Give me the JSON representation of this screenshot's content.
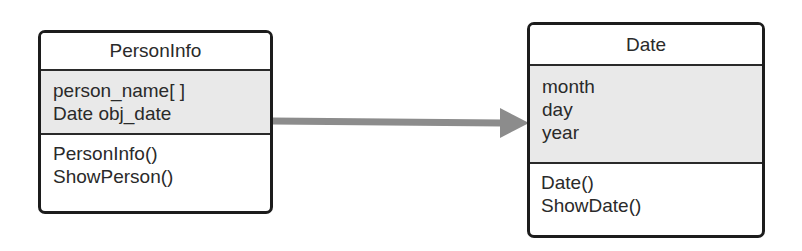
{
  "diagram": {
    "type": "uml-class-diagram",
    "classes": [
      {
        "name": "PersonInfo",
        "attributes": [
          "person_name[ ]",
          "Date obj_date"
        ],
        "methods": [
          "PersonInfo()",
          "ShowPerson()"
        ]
      },
      {
        "name": "Date",
        "attributes": [
          "month",
          "day",
          "year"
        ],
        "methods": [
          "Date()",
          "ShowDate()"
        ]
      }
    ],
    "relations": [
      {
        "from": "PersonInfo",
        "to": "Date",
        "kind": "association-arrow"
      }
    ],
    "colors": {
      "border": "#1c1c1c",
      "attribute_fill": "#e9e9e9",
      "arrow": "#8c8c8c",
      "text": "#2a2a2a"
    }
  }
}
